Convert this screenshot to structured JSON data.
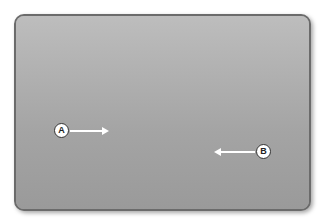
{
  "figure": {
    "labels": {
      "a": "A",
      "b": "B"
    },
    "colors": {
      "frame_border": "#6b6b6b",
      "background": "#a8a8a8",
      "arrow": "#ffffff"
    }
  }
}
